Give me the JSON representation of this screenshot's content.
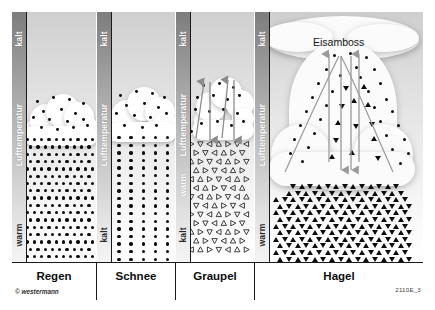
{
  "figure": {
    "code": "2110E_3",
    "copyright": "© westermann"
  },
  "temperature_scales": [
    {
      "id": "scale-regen",
      "axis_label": "Lufttemperatur",
      "top_label": "kalt",
      "bottom_label": "warm",
      "labels": [
        "kalt",
        "Lufttemperatur",
        "warm"
      ]
    },
    {
      "id": "scale-schnee",
      "axis_label": "Lufttemperatur",
      "top_label": "kalt",
      "bottom_label": "kalt",
      "labels": [
        "kalt",
        "Lufttemperatur",
        "kalt"
      ]
    },
    {
      "id": "scale-graupel",
      "axis_label": "Lufttemperatur",
      "top_label": "kalt",
      "mid_label": "warm",
      "bottom_label": "kalt",
      "labels": [
        "kalt",
        "Lufttemperatur",
        "warm",
        "kalt"
      ]
    },
    {
      "id": "scale-hagel",
      "axis_label": "Lufttemperatur",
      "top_label": "kalt",
      "bottom_label": "warm",
      "labels": [
        "kalt",
        "Lufttemperatur",
        "warm"
      ]
    }
  ],
  "panels": [
    {
      "id": "panel-regen",
      "caption": "Regen",
      "precip_type": "rain",
      "glyph": "round-drop",
      "density": "dense"
    },
    {
      "id": "panel-schnee",
      "caption": "Schnee",
      "precip_type": "snow",
      "glyph": "round-flake",
      "density": "medium"
    },
    {
      "id": "panel-graupel",
      "caption": "Graupel",
      "precip_type": "graupel",
      "glyph": "open-triangle",
      "density": "medium",
      "has_updraft": true,
      "has_downdraft": true
    },
    {
      "id": "panel-hagel",
      "caption": "Hagel",
      "precip_type": "hail",
      "glyph": "filled-triangle",
      "density": "very-dense",
      "has_updraft": true,
      "has_downdraft": true,
      "cloud_label": "Eisamboss"
    }
  ],
  "colors": {
    "ink": "#0d0d0d",
    "frame": "#1a1a1a",
    "arrow": "#8c8c8c",
    "cloud": "#ffffff",
    "sky_top": "#cfcfcf",
    "sky_bottom": "#ffffff",
    "bar_cold": "#7d7d7d",
    "bar_warm": "#f4f4f4"
  }
}
